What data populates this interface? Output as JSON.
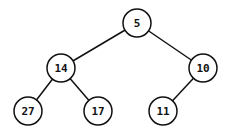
{
  "diagram": {
    "type": "binary-tree",
    "nodes": [
      {
        "id": "n5",
        "label": "5",
        "x": 137,
        "y": 23
      },
      {
        "id": "n14",
        "label": "14",
        "x": 61,
        "y": 68
      },
      {
        "id": "n10",
        "label": "10",
        "x": 203,
        "y": 68
      },
      {
        "id": "n27",
        "label": "27",
        "x": 28,
        "y": 111
      },
      {
        "id": "n17",
        "label": "17",
        "x": 98,
        "y": 111
      },
      {
        "id": "n11",
        "label": "11",
        "x": 163,
        "y": 111
      }
    ],
    "edges": [
      {
        "from": "n5",
        "to": "n14"
      },
      {
        "from": "n5",
        "to": "n10"
      },
      {
        "from": "n14",
        "to": "n27"
      },
      {
        "from": "n14",
        "to": "n17"
      },
      {
        "from": "n10",
        "to": "n11"
      }
    ],
    "node_radius": 14,
    "colors": {
      "stroke": "#111111",
      "fill": "#ffffff",
      "text": "#111111"
    }
  }
}
